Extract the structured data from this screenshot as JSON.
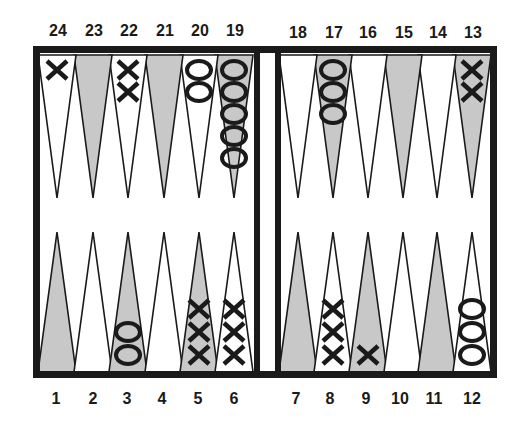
{
  "board": {
    "colors": {
      "frame": "#1a1a1a",
      "dark_point": "#c8c8c8",
      "light_point": "#ffffff",
      "checker_ink": "#1a1a1a"
    },
    "top_labels": [
      "24",
      "23",
      "22",
      "21",
      "20",
      "19",
      "18",
      "17",
      "16",
      "15",
      "14",
      "13"
    ],
    "bottom_labels": [
      "1",
      "2",
      "3",
      "4",
      "5",
      "6",
      "7",
      "8",
      "9",
      "10",
      "11",
      "12"
    ],
    "points": [
      {
        "point": 1,
        "shade": "dark",
        "checkers": "",
        "count": 0
      },
      {
        "point": 2,
        "shade": "light",
        "checkers": "",
        "count": 0
      },
      {
        "point": 3,
        "shade": "dark",
        "checkers": "O",
        "count": 2
      },
      {
        "point": 4,
        "shade": "light",
        "checkers": "",
        "count": 0
      },
      {
        "point": 5,
        "shade": "dark",
        "checkers": "X",
        "count": 3
      },
      {
        "point": 6,
        "shade": "light",
        "checkers": "X",
        "count": 3
      },
      {
        "point": 7,
        "shade": "dark",
        "checkers": "",
        "count": 0
      },
      {
        "point": 8,
        "shade": "light",
        "checkers": "X",
        "count": 3
      },
      {
        "point": 9,
        "shade": "dark",
        "checkers": "X",
        "count": 1
      },
      {
        "point": 10,
        "shade": "light",
        "checkers": "",
        "count": 0
      },
      {
        "point": 11,
        "shade": "dark",
        "checkers": "",
        "count": 0
      },
      {
        "point": 12,
        "shade": "light",
        "checkers": "O",
        "count": 3
      },
      {
        "point": 13,
        "shade": "dark",
        "checkers": "X",
        "count": 2
      },
      {
        "point": 14,
        "shade": "light",
        "checkers": "",
        "count": 0
      },
      {
        "point": 15,
        "shade": "dark",
        "checkers": "",
        "count": 0
      },
      {
        "point": 16,
        "shade": "light",
        "checkers": "",
        "count": 0
      },
      {
        "point": 17,
        "shade": "dark",
        "checkers": "O",
        "count": 3
      },
      {
        "point": 18,
        "shade": "light",
        "checkers": "",
        "count": 0
      },
      {
        "point": 19,
        "shade": "dark",
        "checkers": "O",
        "count": 5
      },
      {
        "point": 20,
        "shade": "light",
        "checkers": "O",
        "count": 2
      },
      {
        "point": 21,
        "shade": "dark",
        "checkers": "",
        "count": 0
      },
      {
        "point": 22,
        "shade": "light",
        "checkers": "X",
        "count": 2
      },
      {
        "point": 23,
        "shade": "dark",
        "checkers": "",
        "count": 0
      },
      {
        "point": 24,
        "shade": "light",
        "checkers": "X",
        "count": 1
      }
    ]
  }
}
